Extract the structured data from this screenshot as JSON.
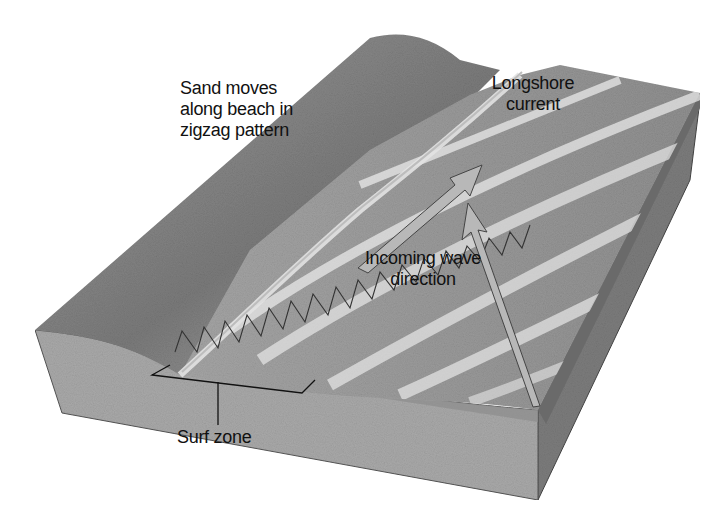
{
  "diagram": {
    "colors": {
      "background": "#ffffff",
      "front_face": "#a9a9a9",
      "side_face": "#7c7c7c",
      "beach": "#8a8a8a",
      "water": "#9a9a9a",
      "wave_highlight": "#e6e6e6",
      "arrow_fill": "#b8b8b8",
      "line": "#222222"
    },
    "labels": {
      "sand_moves": [
        "Sand moves",
        "along beach in",
        "zigzag pattern"
      ],
      "longshore_current": [
        "Longshore",
        "current"
      ],
      "incoming_wave": [
        "Incoming wave",
        "direction"
      ],
      "surf_zone": "Surf zone"
    },
    "icons": {
      "zigzag_arrows": "zigzag-sand-path-icon",
      "longshore_arrow": "longshore-current-arrow-icon",
      "wave_arrow": "incoming-wave-arrow-icon",
      "surf_bracket": "surf-zone-bracket-icon"
    }
  }
}
